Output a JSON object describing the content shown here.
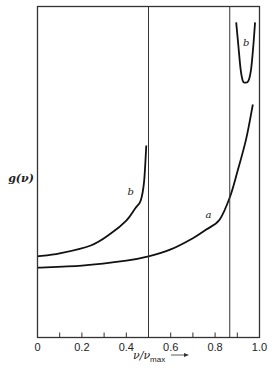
{
  "chart_data": {
    "type": "line",
    "title": "",
    "xlabel": "ν/ν_max",
    "xlabel_main": "ν/ν",
    "xlabel_sub": "max",
    "ylabel": "g(ν)",
    "xlim": [
      0,
      1.0
    ],
    "ylim": [
      0,
      1
    ],
    "y_units": "arbitrary (no numeric ticks shown)",
    "grid": false,
    "legend": null,
    "x_ticks": [
      0,
      0.1,
      0.2,
      0.3,
      0.4,
      0.5,
      0.6,
      0.7,
      0.8,
      0.9,
      1.0
    ],
    "x_tick_labels": [
      {
        "value": 0,
        "label": "0"
      },
      {
        "value": 0.2,
        "label": "0.2"
      },
      {
        "value": 0.4,
        "label": "0.4"
      },
      {
        "value": 0.6,
        "label": "0.6"
      },
      {
        "value": 0.8,
        "label": "0.8"
      },
      {
        "value": 1.0,
        "label": "1.0"
      }
    ],
    "vertical_lines": [
      0.5,
      0.866
    ],
    "series": [
      {
        "name": "a",
        "label": "a",
        "label_pos": {
          "x": 0.77,
          "y": 0.36
        },
        "points": [
          {
            "x": 0.0,
            "y": 0.211
          },
          {
            "x": 0.2,
            "y": 0.217
          },
          {
            "x": 0.4,
            "y": 0.232
          },
          {
            "x": 0.5,
            "y": 0.245
          },
          {
            "x": 0.6,
            "y": 0.266
          },
          {
            "x": 0.7,
            "y": 0.3
          },
          {
            "x": 0.76,
            "y": 0.326
          },
          {
            "x": 0.82,
            "y": 0.356
          },
          {
            "x": 0.866,
            "y": 0.423
          },
          {
            "x": 0.9,
            "y": 0.5
          },
          {
            "x": 0.94,
            "y": 0.6
          },
          {
            "x": 0.97,
            "y": 0.704
          }
        ]
      },
      {
        "name": "b",
        "label": "b",
        "label_pos": {
          "x": 0.42,
          "y": 0.43
        },
        "points": [
          {
            "x": 0.0,
            "y": 0.245
          },
          {
            "x": 0.1,
            "y": 0.254
          },
          {
            "x": 0.24,
            "y": 0.278
          },
          {
            "x": 0.33,
            "y": 0.314
          },
          {
            "x": 0.4,
            "y": 0.353
          },
          {
            "x": 0.44,
            "y": 0.39
          },
          {
            "x": 0.465,
            "y": 0.414
          },
          {
            "x": 0.48,
            "y": 0.47
          },
          {
            "x": 0.49,
            "y": 0.58
          }
        ]
      },
      {
        "name": "b (upper branch)",
        "label": "b",
        "label_pos": {
          "x": 0.94,
          "y": 0.88
        },
        "points": [
          {
            "x": 0.895,
            "y": 0.952
          },
          {
            "x": 0.905,
            "y": 0.88
          },
          {
            "x": 0.915,
            "y": 0.81
          },
          {
            "x": 0.925,
            "y": 0.775
          },
          {
            "x": 0.935,
            "y": 0.77
          },
          {
            "x": 0.95,
            "y": 0.775
          },
          {
            "x": 0.962,
            "y": 0.81
          },
          {
            "x": 0.972,
            "y": 0.88
          },
          {
            "x": 0.98,
            "y": 0.952
          }
        ]
      }
    ]
  }
}
